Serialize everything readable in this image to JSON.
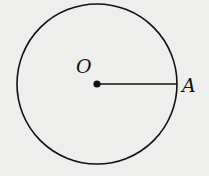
{
  "diagram": {
    "type": "geometry",
    "background": "#eeeeec",
    "stroke_color": "#111111",
    "circle": {
      "cx": 97,
      "cy": 84,
      "r": 80
    },
    "center_point": {
      "label": "O",
      "x": 97,
      "y": 84
    },
    "point_on_circle": {
      "label": "A",
      "x": 177,
      "y": 84
    },
    "segment": {
      "from": "O",
      "to": "A",
      "description": "radius OA"
    }
  }
}
